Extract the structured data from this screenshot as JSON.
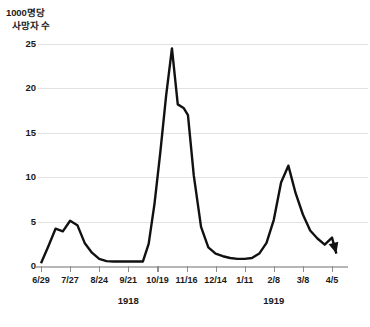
{
  "chart_data": {
    "type": "line",
    "title": "",
    "ylabel": "1000명당 사망자 수",
    "ylabel_lines": [
      "1000명당",
      "사망자 수"
    ],
    "xlabel": "",
    "ylim": [
      0,
      25
    ],
    "yticks": [
      0,
      5,
      10,
      15,
      20,
      25
    ],
    "ytick_labels": [
      "0",
      "5",
      "10",
      "15",
      "20",
      "25"
    ],
    "grid": true,
    "legend": null,
    "line_color": "#111111",
    "grid_color": "#e2e2e2",
    "axis_color": "#b6b6b6",
    "end_marker": "arrowhead",
    "categories": [
      "6/29",
      "7/27",
      "8/24",
      "9/21",
      "10/19",
      "11/16",
      "12/14",
      "1/11",
      "2/8",
      "3/8",
      "4/5"
    ],
    "xtick_labels": [
      "6/29",
      "7/27",
      "8/24",
      "9/21",
      "10/19",
      "11/16",
      "12/14",
      "1/11",
      "2/8",
      "3/8",
      "4/5"
    ],
    "year_groups": [
      {
        "label": "1918",
        "center_tick": 3
      },
      {
        "label": "1919",
        "center_tick": 8
      }
    ],
    "series": [
      {
        "name": "1000명당 사망자 수",
        "x": [
          0.0,
          0.25,
          0.5,
          0.75,
          1.0,
          1.25,
          1.5,
          1.75,
          2.0,
          2.25,
          2.5,
          2.75,
          3.0,
          3.25,
          3.5,
          3.7,
          3.9,
          4.1,
          4.3,
          4.5,
          4.7,
          4.9,
          5.05,
          5.25,
          5.5,
          5.75,
          6.0,
          6.25,
          6.5,
          6.75,
          7.0,
          7.25,
          7.5,
          7.75,
          8.0,
          8.25,
          8.5,
          8.75,
          9.0,
          9.25,
          9.5,
          9.75,
          10.0,
          10.15
        ],
        "values": [
          0.3,
          2.2,
          4.2,
          3.9,
          5.1,
          4.6,
          2.6,
          1.5,
          0.8,
          0.55,
          0.5,
          0.5,
          0.5,
          0.5,
          0.5,
          2.5,
          7.0,
          12.8,
          19.2,
          24.5,
          18.2,
          17.8,
          17.0,
          10.2,
          4.4,
          2.1,
          1.4,
          1.1,
          0.9,
          0.8,
          0.8,
          0.9,
          1.4,
          2.6,
          5.2,
          9.4,
          11.3,
          8.2,
          5.8,
          4.0,
          3.1,
          2.4,
          3.2,
          1.4
        ]
      }
    ],
    "annotations": [
      {
        "text": "주요 유행 정점",
        "value": 24.5,
        "at": "10/26"
      }
    ]
  }
}
